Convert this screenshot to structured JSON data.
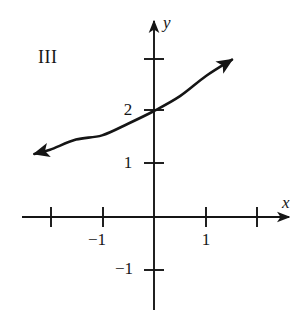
{
  "figure": {
    "panel_label": "III",
    "background_color": "#ffffff",
    "stroke_color": "#151515",
    "width": 306,
    "height": 317
  },
  "axes": {
    "x_axis_label": "x",
    "y_axis_label": "y",
    "origin_px": {
      "x": 154,
      "y": 217
    },
    "unit_px": {
      "x": 52,
      "y": 53
    },
    "x_ticks": [
      {
        "value": -2,
        "label": "",
        "px": 51
      },
      {
        "value": -1,
        "label": "−1",
        "px": 103
      },
      {
        "value": 1,
        "label": "1",
        "px": 206
      },
      {
        "value": 2,
        "label": "",
        "px": 257
      }
    ],
    "y_ticks": [
      {
        "value": 3,
        "label": "",
        "px": 59
      },
      {
        "value": 2,
        "label": "2",
        "px": 110
      },
      {
        "value": 1,
        "label": "1",
        "px": 163
      },
      {
        "value": -1,
        "label": "−1",
        "px": 270
      }
    ],
    "x_arrow_tip_px": {
      "x": 293,
      "y": 217
    },
    "y_arrow_tip_px": {
      "x": 154,
      "y": 17
    }
  },
  "chart_data": {
    "type": "line",
    "title": "III",
    "xlabel": "x",
    "ylabel": "y",
    "xlim": [
      -2.3,
      2.7
    ],
    "ylim": [
      -1.9,
      3.8
    ],
    "grid": false,
    "legend": null,
    "series": [
      {
        "name": "y = 2(1.3)^x",
        "equation": "y = 2 * 1.3^x",
        "y_intercept": 2,
        "arrow_start": true,
        "arrow_end": true,
        "x": [
          -2.3,
          -2.0,
          -1.5,
          -1.0,
          -0.5,
          0.0,
          0.5,
          1.0,
          1.5
        ],
        "y": [
          1.19,
          1.27,
          1.46,
          1.54,
          1.76,
          2.0,
          2.28,
          2.66,
          2.97
        ]
      }
    ],
    "annotations": [
      {
        "text": "III",
        "x_px": 38,
        "y_px": 48
      },
      {
        "text": "2",
        "note": "y-axis tick label at y = 2"
      },
      {
        "text": "1",
        "note": "y-axis tick label at y = 1"
      },
      {
        "text": "−1",
        "note": "y-axis tick label at y = -1"
      },
      {
        "text": "−1",
        "note": "x-axis tick label at x = -1"
      },
      {
        "text": "1",
        "note": "x-axis tick label at x = 1"
      }
    ]
  }
}
